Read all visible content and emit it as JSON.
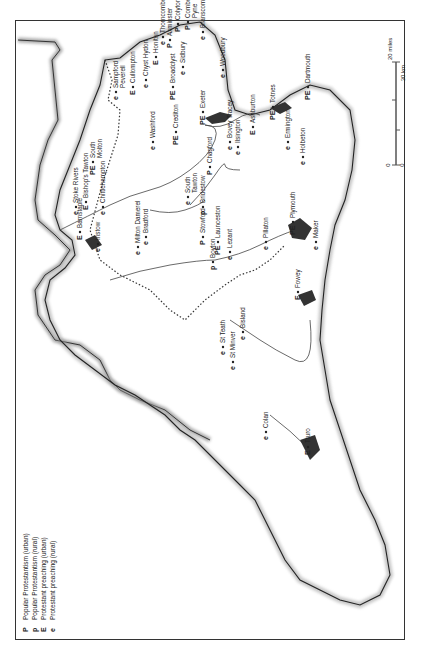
{
  "legend": {
    "items": [
      {
        "symbol": "P",
        "label": "Popular Protestantism (urban)"
      },
      {
        "symbol": "p",
        "label": "Popular Protestantism (rural)"
      },
      {
        "symbol": "E",
        "label": "Protestant preaching (urban)"
      },
      {
        "symbol": "e",
        "label": "Protestant preaching (rural)"
      }
    ]
  },
  "scale": {
    "miles_zero": "0",
    "miles_max": "20 miles",
    "km_zero": "0",
    "km_max": "30 km"
  },
  "places": [
    {
      "name": "Sampford Peverell",
      "line1": "Sampford",
      "line2": "Peverell",
      "symbol": "e",
      "x": 118,
      "y": 100
    },
    {
      "name": "Thorncombe",
      "line1": "Thorncombe",
      "symbol": "e",
      "x": 165,
      "y": 45
    },
    {
      "name": "Cullompton",
      "line1": "Cullompton",
      "symbol": "E",
      "x": 135,
      "y": 95
    },
    {
      "name": "Chyst Hydon",
      "line1": "Chyst Hydon",
      "symbol": "e",
      "x": 148,
      "y": 88
    },
    {
      "name": "Honiton",
      "line1": "Honiton",
      "symbol": "E",
      "x": 158,
      "y": 65
    },
    {
      "name": "Axminster",
      "line1": "Axminster",
      "symbol": "P",
      "x": 172,
      "y": 48
    },
    {
      "name": "Colyton",
      "line1": "Colyton",
      "symbol": "P",
      "x": 180,
      "y": 32
    },
    {
      "name": "Combe Pyne",
      "line1": "Combe",
      "line2": "Pyne",
      "symbol": "P",
      "x": 190,
      "y": 30
    },
    {
      "name": "Branscombe",
      "line1": "Branscombe",
      "symbol": "e",
      "x": 205,
      "y": 40
    },
    {
      "name": "Broadclyst",
      "line1": "Broadclyst",
      "symbol": "PE",
      "x": 175,
      "y": 100
    },
    {
      "name": "Sidbury",
      "line1": "Sidbury",
      "symbol": "e",
      "x": 185,
      "y": 75
    },
    {
      "name": "Woodbury",
      "line1": "Woodbury",
      "symbol": "e",
      "x": 225,
      "y": 78
    },
    {
      "name": "Exeter",
      "line1": "Exeter",
      "symbol": "PE",
      "x": 205,
      "y": 125
    },
    {
      "name": "Washford",
      "line1": "Washford",
      "symbol": "e",
      "x": 155,
      "y": 150
    },
    {
      "name": "Crediton",
      "line1": "Crediton",
      "symbol": "PE",
      "x": 178,
      "y": 145
    },
    {
      "name": "Chagford",
      "line1": "Chagford",
      "symbol": "P",
      "x": 212,
      "y": 175
    },
    {
      "name": "Bovey Tracey",
      "line1": "Bovey Tracey",
      "symbol": "e",
      "x": 232,
      "y": 150
    },
    {
      "name": "Ilsington",
      "line1": "Ilsington",
      "symbol": "e",
      "x": 240,
      "y": 155
    },
    {
      "name": "Ashburton",
      "line1": "Ashburton",
      "symbol": "E",
      "x": 255,
      "y": 135
    },
    {
      "name": "Totnes",
      "line1": "Totnes",
      "symbol": "PE",
      "x": 275,
      "y": 120
    },
    {
      "name": "Dartmouth",
      "line1": "Dartmouth",
      "symbol": "PE",
      "x": 310,
      "y": 100
    },
    {
      "name": "Ermington",
      "line1": "Ermington",
      "symbol": "e",
      "x": 290,
      "y": 150
    },
    {
      "name": "Holbeton",
      "line1": "Holbeton",
      "symbol": "e",
      "x": 305,
      "y": 165
    },
    {
      "name": "Plymouth",
      "line1": "Plymouth",
      "symbol": "PE",
      "x": 295,
      "y": 235
    },
    {
      "name": "Maker",
      "line1": "Maker",
      "symbol": "e",
      "x": 318,
      "y": 250
    },
    {
      "name": "Stoke Rivers",
      "line1": "Stoke Rivers",
      "symbol": "e",
      "x": 78,
      "y": 215
    },
    {
      "name": "Bishop's Tawton",
      "line1": "Bishop's Tawton",
      "symbol": "E",
      "x": 88,
      "y": 210
    },
    {
      "name": "South Molton",
      "line1": "South",
      "line2": "Molton",
      "symbol": "PE",
      "x": 95,
      "y": 175
    },
    {
      "name": "Barnstaple",
      "line1": "Barnstaple",
      "symbol": "E",
      "x": 82,
      "y": 240
    },
    {
      "name": "Instow",
      "line1": "Instow",
      "symbol": "e",
      "x": 100,
      "y": 252
    },
    {
      "name": "Chittlehampton",
      "line1": "Chittlehampton",
      "symbol": "e",
      "x": 105,
      "y": 215
    },
    {
      "name": "Milton Damerel",
      "line1": "Milton Damerel",
      "symbol": "e",
      "x": 140,
      "y": 255
    },
    {
      "name": "Bradford",
      "line1": "Bradford",
      "symbol": "e",
      "x": 148,
      "y": 245
    },
    {
      "name": "South Tawton",
      "line1": "South",
      "line2": "Tawton",
      "symbol": "e",
      "x": 190,
      "y": 205
    },
    {
      "name": "Bridestow",
      "line1": "Bridestow",
      "symbol": "p",
      "x": 205,
      "y": 215
    },
    {
      "name": "Stowford",
      "line1": "Stowford",
      "symbol": "P",
      "x": 205,
      "y": 245
    },
    {
      "name": "Boyton",
      "line1": "Boyton",
      "symbol": "p",
      "x": 215,
      "y": 270
    },
    {
      "name": "Launceston",
      "line1": "Launceston",
      "symbol": "PE",
      "x": 220,
      "y": 255
    },
    {
      "name": "Lezant",
      "line1": "Lezant",
      "symbol": "e",
      "x": 232,
      "y": 260
    },
    {
      "name": "Pillaton",
      "line1": "Pillaton",
      "symbol": "e",
      "x": 268,
      "y": 250
    },
    {
      "name": "St Teath",
      "line1": "St Teath",
      "symbol": "e",
      "x": 225,
      "y": 355
    },
    {
      "name": "St Minver",
      "line1": "St Minver",
      "symbol": "e",
      "x": 235,
      "y": 370
    },
    {
      "name": "Bodmin",
      "line1": "Bisland",
      "symbol": "e",
      "x": 245,
      "y": 340
    },
    {
      "name": "Fowey",
      "line1": "Fowey",
      "symbol": "E",
      "x": 300,
      "y": 300
    },
    {
      "name": "Colan",
      "line1": "Colan",
      "symbol": "e",
      "x": 268,
      "y": 440
    },
    {
      "name": "Truro",
      "line1": "Truro",
      "symbol": "E",
      "x": 310,
      "y": 455
    }
  ]
}
